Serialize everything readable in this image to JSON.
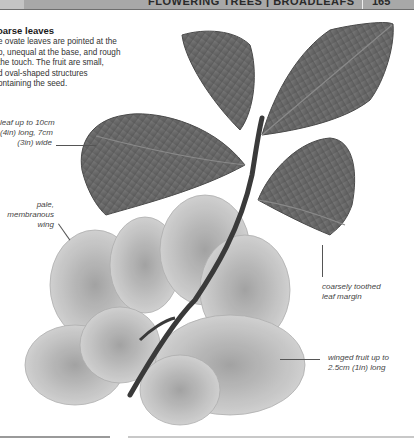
{
  "header": {
    "running_title": "FLOWERING TREES | BROADLEAFS",
    "page_number": "165"
  },
  "section": {
    "title": "Coarse leaves",
    "title_visible": "oarse leaves",
    "body_lines": [
      "e ovate leaves are pointed at the",
      "p, unequal at the base, and rough",
      "the touch. The fruit are small,",
      "d oval-shaped structures",
      "ontaining the seed."
    ]
  },
  "callouts": {
    "leaf_size": [
      "leaf up to 10cm",
      "(4in) long, 7cm",
      "(3in) wide"
    ],
    "wing": [
      "pale,",
      "membranous",
      "wing"
    ],
    "margin": [
      "coarsely toothed",
      "leaf margin"
    ],
    "fruit": [
      "winged fruit up to",
      "2.5cm (1in) long"
    ]
  },
  "colors": {
    "leaf": "#6b6b6b",
    "leaf_dark": "#4a4a4a",
    "wing": "#bdbdbd",
    "stem": "#3a3a3a",
    "header_bar": "#a8a8a8"
  }
}
